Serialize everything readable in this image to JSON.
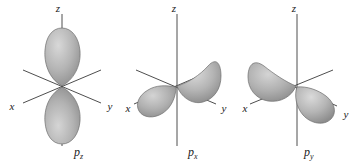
{
  "figure": {
    "type": "orbital-diagram",
    "background_color": "#ffffff",
    "lobe_fill": "#b0b0b0",
    "lobe_stroke": "#6e6e6e",
    "axis_color": "#3a3a3a",
    "text_color": "#1a1a1a"
  },
  "panels": [
    {
      "id": "pz",
      "orbital_label": "p",
      "orbital_subscript": "z",
      "axes": [
        {
          "name": "z",
          "label": "z",
          "direction": "vertical-up"
        },
        {
          "name": "x",
          "label": "x",
          "direction": "lower-left"
        },
        {
          "name": "y",
          "label": "y",
          "direction": "lower-right"
        }
      ],
      "lobes": [
        {
          "along": "z",
          "sign": "up"
        },
        {
          "along": "z",
          "sign": "down"
        }
      ]
    },
    {
      "id": "px",
      "orbital_label": "p",
      "orbital_subscript": "x",
      "axes": [
        {
          "name": "z",
          "label": "z",
          "direction": "vertical-up"
        },
        {
          "name": "x",
          "label": "x",
          "direction": "lower-left"
        },
        {
          "name": "y",
          "label": "y",
          "direction": "lower-right"
        }
      ],
      "lobes": [
        {
          "along": "x",
          "sign": "front-right"
        },
        {
          "along": "x",
          "sign": "back-left"
        }
      ]
    },
    {
      "id": "py",
      "orbital_label": "p",
      "orbital_subscript": "y",
      "axes": [
        {
          "name": "z",
          "label": "z",
          "direction": "vertical-up"
        },
        {
          "name": "x",
          "label": "x",
          "direction": "lower-left"
        },
        {
          "name": "y",
          "label": "y",
          "direction": "lower-right"
        }
      ],
      "lobes": [
        {
          "along": "y",
          "sign": "front-right"
        },
        {
          "along": "y",
          "sign": "back-left"
        }
      ]
    }
  ]
}
